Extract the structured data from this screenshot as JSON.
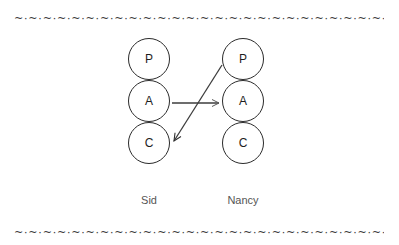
{
  "figure": {
    "type": "transactional-analysis-diagram",
    "background_color": "#ffffff",
    "stroke_color": "#2b2b2b",
    "label_color": "#555555"
  },
  "borders": {
    "pattern": "~·~·~·~·~·~·~·~·~·~·~·~·~·~·~·~·~·~·~·~·~·~·~·~·~·~·~·~·~·~·~·~·~·~·~·~·~·~·~",
    "top_label": "decorative-wave-rule-top",
    "bottom_label": "decorative-wave-rule-bottom"
  },
  "columns": [
    {
      "id": "sid",
      "name": "Sid",
      "states": [
        {
          "code": "P",
          "name": "Parent"
        },
        {
          "code": "A",
          "name": "Adult"
        },
        {
          "code": "C",
          "name": "Child"
        }
      ]
    },
    {
      "id": "nancy",
      "name": "Nancy",
      "states": [
        {
          "code": "P",
          "name": "Parent"
        },
        {
          "code": "A",
          "name": "Adult"
        },
        {
          "code": "C",
          "name": "Child"
        }
      ]
    }
  ],
  "transactions": [
    {
      "id": "stimulus",
      "kind": "horizontal",
      "from": "sid.A",
      "to": "nancy.A",
      "from_point": [
        172,
        103
      ],
      "to_point": [
        221,
        103
      ],
      "color": "#3c3c3c",
      "head": "open-arrow"
    },
    {
      "id": "crossed-response",
      "kind": "diagonal",
      "from": "nancy.P",
      "to": "sid.C",
      "from_point": [
        222,
        65
      ],
      "to_point": [
        172,
        143
      ],
      "color": "#3c3c3c",
      "head": "open-arrow"
    }
  ]
}
